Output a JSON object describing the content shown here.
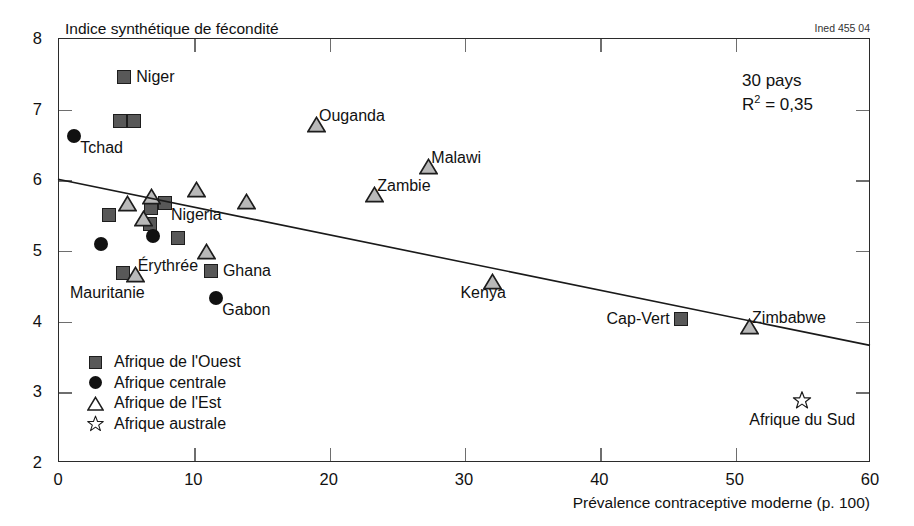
{
  "figure": {
    "source_code": "Ined 455 04",
    "y_axis_title": "Indice synthétique de fécondité",
    "x_axis_title": "Prévalence contraceptive moderne (p. 100)",
    "annotation_line1": "30 pays",
    "annotation_r": "R",
    "annotation_sup": "2",
    "annotation_rest": " = 0,35"
  },
  "chart_data": {
    "type": "scatter",
    "title": "",
    "xlabel": "Prévalence contraceptive moderne (p. 100)",
    "ylabel": "Indice synthétique de fécondité",
    "xlim": [
      0,
      60
    ],
    "ylim": [
      2,
      8
    ],
    "xticks": [
      0,
      10,
      20,
      30,
      40,
      50,
      60
    ],
    "yticks": [
      2,
      3,
      4,
      5,
      6,
      7,
      8
    ],
    "xtick_labels": [
      "0",
      "10",
      "20",
      "30",
      "40",
      "50",
      "60"
    ],
    "ytick_labels": [
      "2",
      "3",
      "4",
      "5",
      "6",
      "7",
      "8"
    ],
    "grid": false,
    "legend_position": "lower-left-inside",
    "n_countries": 30,
    "r_squared": 0.35,
    "trendline": {
      "type": "linear",
      "x": [
        0,
        60
      ],
      "y": [
        6.0,
        3.65
      ]
    },
    "series": [
      {
        "name": "Afrique de l'Ouest",
        "marker": "square",
        "color": "#585858",
        "points": [
          {
            "x": 4.9,
            "y": 7.45,
            "label": "Niger",
            "label_pos": "right"
          },
          {
            "x": 4.6,
            "y": 6.82,
            "label": "",
            "label_pos": ""
          },
          {
            "x": 5.6,
            "y": 6.82,
            "label": "",
            "label_pos": ""
          },
          {
            "x": 3.8,
            "y": 5.5,
            "label": "",
            "label_pos": ""
          },
          {
            "x": 6.9,
            "y": 5.6,
            "label": "",
            "label_pos": ""
          },
          {
            "x": 6.8,
            "y": 5.37,
            "label": "",
            "label_pos": ""
          },
          {
            "x": 7.9,
            "y": 5.67,
            "label": "Nigeria",
            "label_pos": "below-right"
          },
          {
            "x": 8.9,
            "y": 5.17,
            "label": "",
            "label_pos": ""
          },
          {
            "x": 4.8,
            "y": 4.68,
            "label": "Mauritanie",
            "label_pos": "below-left"
          },
          {
            "x": 11.3,
            "y": 4.7,
            "label": "Ghana",
            "label_pos": "right"
          },
          {
            "x": 46.0,
            "y": 4.03,
            "label": "Cap-Vert",
            "label_pos": "left"
          }
        ]
      },
      {
        "name": "Afrique centrale",
        "marker": "circle",
        "color": "#111111",
        "points": [
          {
            "x": 1.2,
            "y": 6.62,
            "label": "Tchad",
            "label_pos": "below-right"
          },
          {
            "x": 3.2,
            "y": 5.09,
            "label": "",
            "label_pos": ""
          },
          {
            "x": 7.0,
            "y": 5.2,
            "label": "",
            "label_pos": ""
          },
          {
            "x": 11.7,
            "y": 4.32,
            "label": "Gabon",
            "label_pos": "below-right"
          }
        ]
      },
      {
        "name": "Afrique de l'Est",
        "marker": "triangle",
        "color": "#b9b9b9",
        "points": [
          {
            "x": 18.4,
            "y": 6.9,
            "label": "Ouganda",
            "label_pos": "right"
          },
          {
            "x": 26.7,
            "y": 6.3,
            "label": "Malawi",
            "label_pos": "right"
          },
          {
            "x": 22.7,
            "y": 5.9,
            "label": "Zambie",
            "label_pos": "right"
          },
          {
            "x": 9.5,
            "y": 5.98,
            "label": "",
            "label_pos": ""
          },
          {
            "x": 6.2,
            "y": 5.88,
            "label": "",
            "label_pos": ""
          },
          {
            "x": 4.4,
            "y": 5.78,
            "label": "",
            "label_pos": ""
          },
          {
            "x": 13.2,
            "y": 5.8,
            "label": "",
            "label_pos": ""
          },
          {
            "x": 5.6,
            "y": 5.56,
            "label": "",
            "label_pos": ""
          },
          {
            "x": 10.3,
            "y": 5.1,
            "label": "",
            "label_pos": ""
          },
          {
            "x": 5.0,
            "y": 4.78,
            "label": "Érythrée",
            "label_pos": "right"
          },
          {
            "x": 31.4,
            "y": 4.68,
            "label": "Kenya",
            "label_pos": "below"
          },
          {
            "x": 50.4,
            "y": 4.04,
            "label": "Zimbabwe",
            "label_pos": "right"
          }
        ]
      },
      {
        "name": "Afrique australe",
        "marker": "star",
        "color": "#ffffff",
        "points": [
          {
            "x": 55.0,
            "y": 2.88,
            "label": "Afrique du Sud",
            "label_pos": "below"
          }
        ]
      }
    ],
    "legend_entries": [
      {
        "label": "Afrique de l'Ouest",
        "marker": "square"
      },
      {
        "label": "Afrique centrale",
        "marker": "circle"
      },
      {
        "label": "Afrique de l'Est",
        "marker": "triangle"
      },
      {
        "label": "Afrique australe",
        "marker": "star"
      }
    ]
  }
}
